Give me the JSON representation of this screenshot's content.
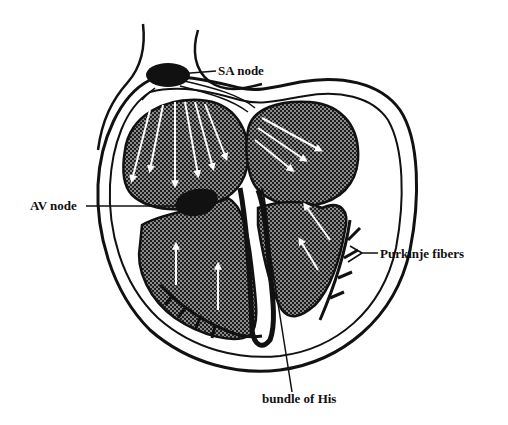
{
  "diagram": {
    "labels": {
      "sa_node": "SA node",
      "av_node": "AV node",
      "purkinje_fibers": "Purkinje fibers",
      "bundle_of_his": "bundle of His"
    },
    "colors": {
      "ink": "#111111",
      "background": "#ffffff",
      "chamber_fill": "#2a2a2a",
      "arrow": "#ffffff"
    }
  }
}
